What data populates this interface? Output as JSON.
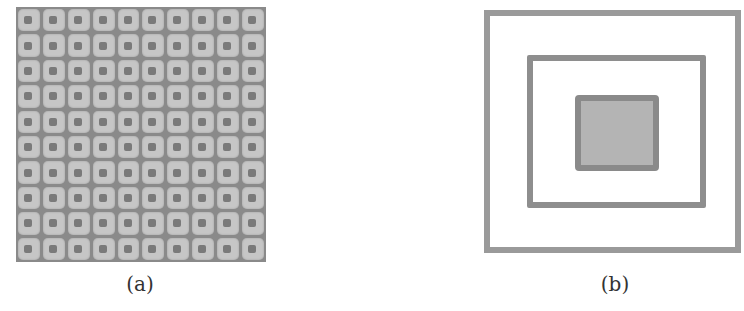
{
  "figure": {
    "panels": [
      {
        "id": "a",
        "caption": "(a)",
        "description": "10x10 grid of rounded light-gray squares, each with a dark center dot, on a darker gray background",
        "rows": 10,
        "cols": 10,
        "colors": {
          "background": "#8a8a8a",
          "cell": "#c6c6c6",
          "dot": "#7a7a7a"
        }
      },
      {
        "id": "b",
        "caption": "(b)",
        "description": "Three concentric rectangles: outer outline, middle outline, inner filled square",
        "colors": {
          "outer_stroke": "#9a9a9a",
          "middle_stroke": "#8e8e8e",
          "inner_stroke": "#8a8a8a",
          "inner_fill": "#b4b4b4"
        }
      }
    ]
  }
}
